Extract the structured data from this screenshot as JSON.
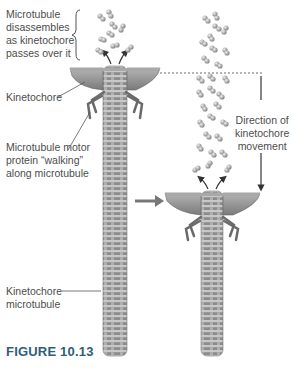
{
  "labels": {
    "disassembly": [
      "Microtubule",
      "disassembles",
      "as kinetochore",
      "passes over it"
    ],
    "kinetochore": "Kinetochore",
    "motor_protein": [
      "Microtubule motor",
      "protein “walking”",
      "along microtubule"
    ],
    "direction": [
      "Direction of",
      "kinetochore",
      "movement"
    ],
    "kinetochore_microtubule": [
      "Kinetochore",
      "microtubule"
    ]
  },
  "figure_caption": "FIGURE 10.13",
  "colors": {
    "caption": "#2f5d7c",
    "tubule": "#9a9a9a",
    "kinetochore": "#8e8e8e",
    "text": "#4d4d4d"
  }
}
